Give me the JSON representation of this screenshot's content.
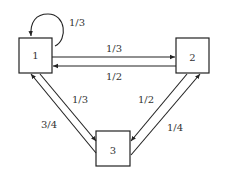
{
  "diagram": {
    "type": "markov-chain-transition-graph",
    "nodes": [
      {
        "id": "1",
        "label": "1"
      },
      {
        "id": "2",
        "label": "2"
      },
      {
        "id": "3",
        "label": "3"
      }
    ],
    "edges": [
      {
        "from": "1",
        "to": "1",
        "label": "1/3"
      },
      {
        "from": "1",
        "to": "2",
        "label": "1/3"
      },
      {
        "from": "2",
        "to": "1",
        "label": "1/2"
      },
      {
        "from": "1",
        "to": "3",
        "label": "1/3"
      },
      {
        "from": "3",
        "to": "1",
        "label": "3/4"
      },
      {
        "from": "2",
        "to": "3",
        "label": "1/2"
      },
      {
        "from": "3",
        "to": "2",
        "label": "1/4"
      }
    ]
  }
}
